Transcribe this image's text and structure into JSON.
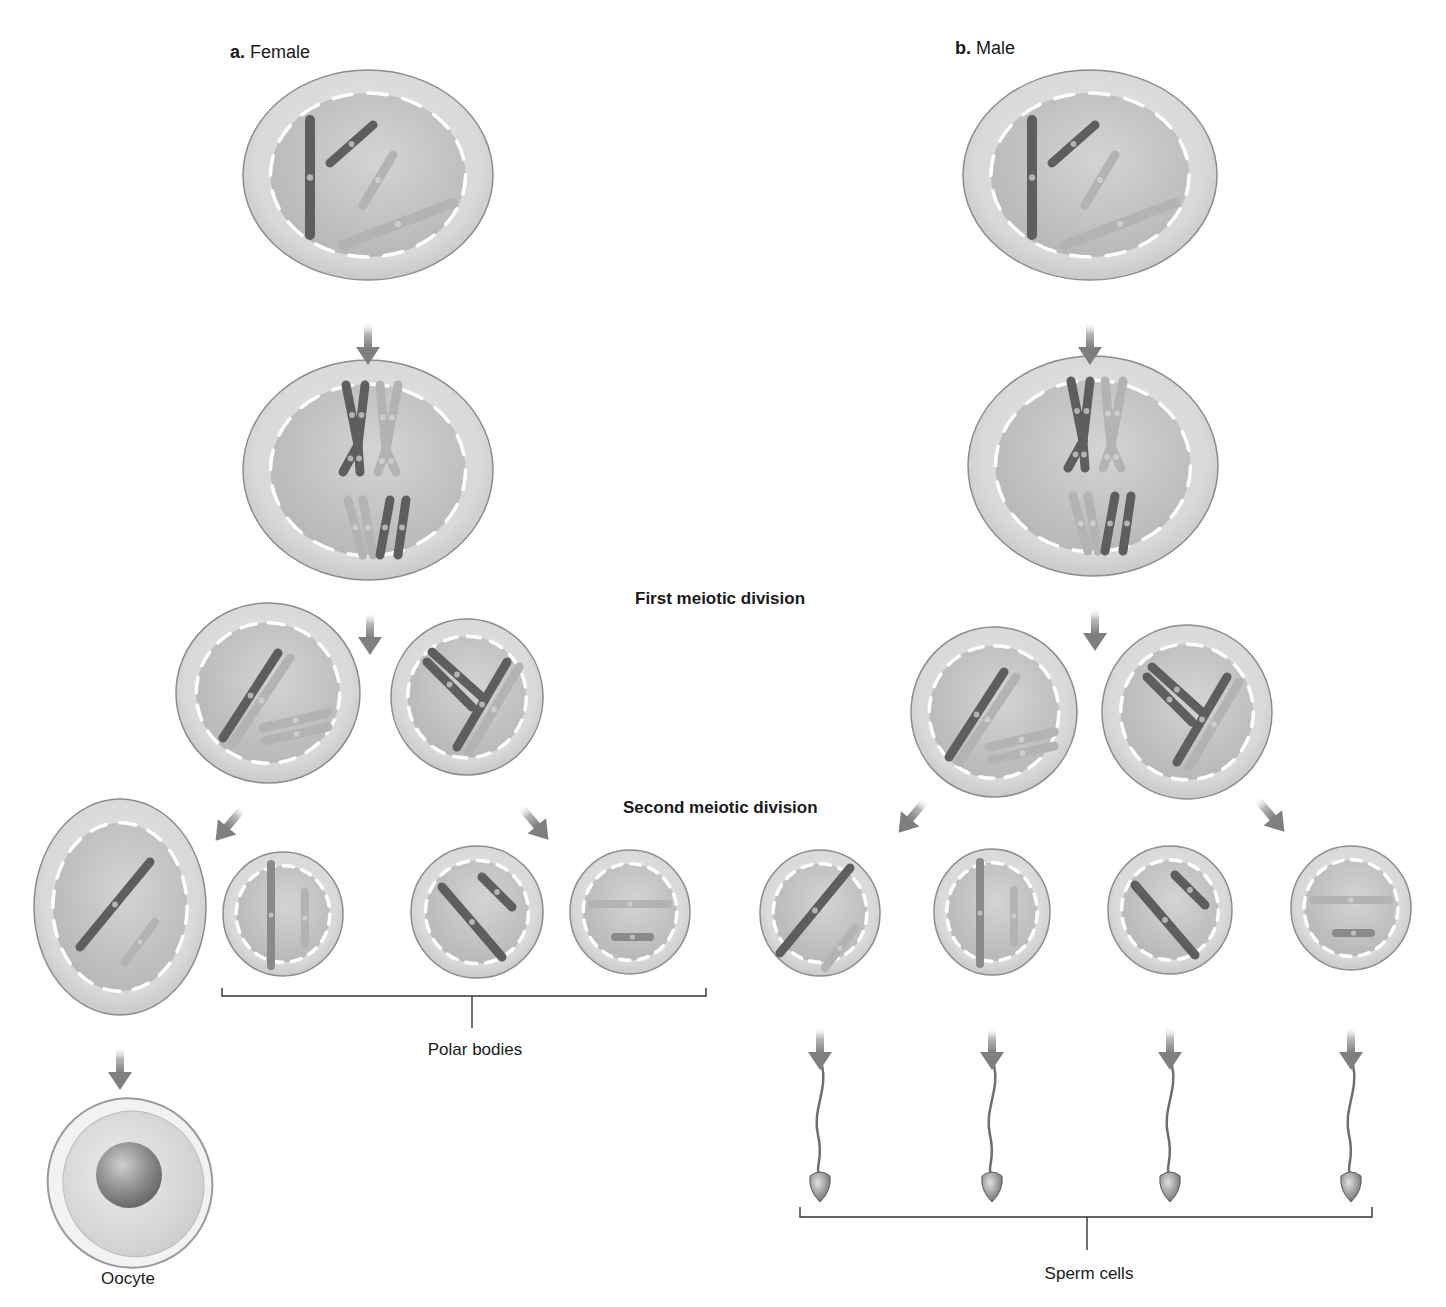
{
  "panels": {
    "female": {
      "letter": "a.",
      "title": "Female"
    },
    "male": {
      "letter": "b.",
      "title": "Male"
    }
  },
  "stage_labels": {
    "first": "First meiotic division",
    "second": "Second meiotic division"
  },
  "captions": {
    "polar_bodies": "Polar bodies",
    "oocyte": "Oocyte",
    "sperm_cells": "Sperm cells"
  },
  "colors": {
    "background": "#ffffff",
    "cell_outer": "#d6d6d6",
    "cell_outer_edge": "#8c8c8c",
    "nucleus": "#c4c4c4",
    "nuclear_envelope_dash": "#ffffff",
    "chromosome_dark": "#5e5e5e",
    "chromosome_mid": "#8a8a8a",
    "chromosome_light": "#b3b3b3",
    "arrow": "#8a8a8a",
    "bracket": "#333333"
  },
  "cells": {
    "female": {
      "parent": {
        "cx": 368,
        "cy": 175,
        "rx": 125,
        "ry": 105
      },
      "tetrad": {
        "cx": 368,
        "cy": 470,
        "rx": 125,
        "ry": 110
      },
      "meiosis1": [
        {
          "cx": 268,
          "cy": 693,
          "rx": 92,
          "ry": 90
        },
        {
          "cx": 467,
          "cy": 697,
          "rx": 76,
          "ry": 78
        }
      ],
      "meiosis2": [
        {
          "cx": 120,
          "cy": 907,
          "rx": 86,
          "ry": 108,
          "role": "oocyte-precursor"
        },
        {
          "cx": 283,
          "cy": 914,
          "rx": 60,
          "ry": 62,
          "role": "polar-body"
        },
        {
          "cx": 477,
          "cy": 912,
          "rx": 66,
          "ry": 66,
          "role": "polar-body"
        },
        {
          "cx": 630,
          "cy": 912,
          "rx": 60,
          "ry": 62,
          "role": "polar-body"
        }
      ],
      "oocyte": {
        "cx": 130,
        "cy": 1183,
        "rx": 82,
        "ry": 85
      }
    },
    "male": {
      "parent": {
        "cx": 1090,
        "cy": 175,
        "rx": 127,
        "ry": 105
      },
      "tetrad": {
        "cx": 1093,
        "cy": 466,
        "rx": 125,
        "ry": 110
      },
      "meiosis1": [
        {
          "cx": 994,
          "cy": 712,
          "rx": 83,
          "ry": 85
        },
        {
          "cx": 1187,
          "cy": 712,
          "rx": 85,
          "ry": 87
        }
      ],
      "meiosis2": [
        {
          "cx": 820,
          "cy": 913,
          "rx": 60,
          "ry": 63
        },
        {
          "cx": 992,
          "cy": 912,
          "rx": 58,
          "ry": 63
        },
        {
          "cx": 1170,
          "cy": 910,
          "rx": 62,
          "ry": 64
        },
        {
          "cx": 1351,
          "cy": 908,
          "rx": 60,
          "ry": 62
        }
      ],
      "sperm_x": [
        820,
        992,
        1170,
        1351
      ]
    }
  }
}
